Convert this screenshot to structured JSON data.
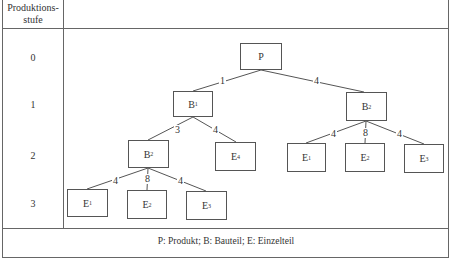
{
  "table": {
    "header": "Produktions-\nstufe",
    "header_line1": "Produktions-",
    "header_line2": "stufe",
    "levels": [
      "0",
      "1",
      "2",
      "3"
    ],
    "footer": "P: Produkt; B: Bauteil; E: Einzelteil"
  },
  "nodes": {
    "P": {
      "base": "P",
      "sub": ""
    },
    "B1": {
      "base": "B",
      "sub": "1"
    },
    "B2r": {
      "base": "B",
      "sub": "2"
    },
    "B2l": {
      "base": "B",
      "sub": "2"
    },
    "E4": {
      "base": "E",
      "sub": "4"
    },
    "E1r": {
      "base": "E",
      "sub": "1"
    },
    "E2r": {
      "base": "E",
      "sub": "2"
    },
    "E3r": {
      "base": "E",
      "sub": "3"
    },
    "E1l": {
      "base": "E",
      "sub": "1"
    },
    "E2l": {
      "base": "E",
      "sub": "2"
    },
    "E3l": {
      "base": "E",
      "sub": "3"
    }
  },
  "quantities": {
    "P_B1": "1",
    "P_B2r": "4",
    "B1_B2l": "3",
    "B1_E4": "4",
    "B2r_E1r": "4",
    "B2r_E2r": "8",
    "B2r_E3r": "4",
    "B2l_E1l": "4",
    "B2l_E2l": "8",
    "B2l_E3l": "4"
  },
  "colors": {
    "line": "#555555",
    "text": "#333333",
    "background": "#ffffff"
  }
}
